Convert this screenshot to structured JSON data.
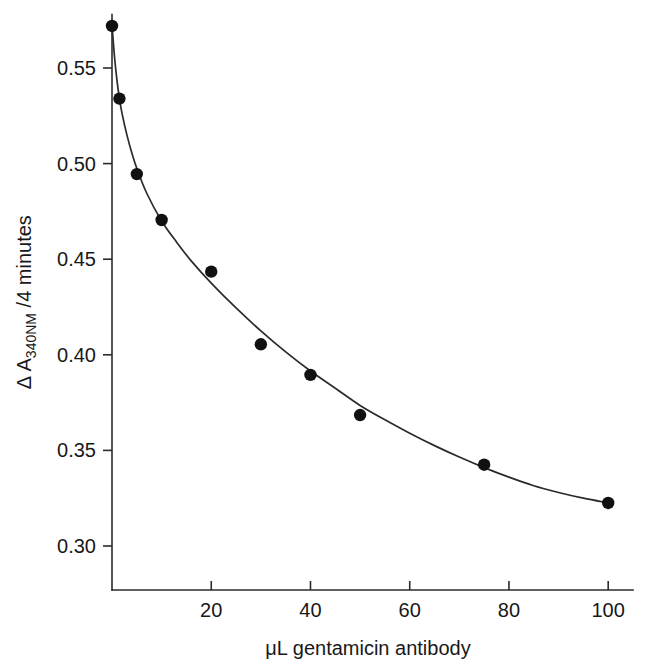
{
  "chart_data": {
    "type": "scatter",
    "title": "",
    "subtitle": "",
    "xlabel": "μL gentamicin antibody",
    "ylabel": "Δ A340NM /4 minutes",
    "ylabel_parts": {
      "delta": "Δ",
      "base": "A",
      "subscript": "340NM",
      "suffix": "/4 minutes"
    },
    "x": [
      0,
      1.5,
      5,
      10,
      20,
      30,
      40,
      50,
      75,
      100
    ],
    "y": [
      0.572,
      0.534,
      0.4945,
      0.4705,
      0.4435,
      0.4055,
      0.3895,
      0.3685,
      0.3425,
      0.3225
    ],
    "series": [
      {
        "name": "ΔA340NM per 4 minutes",
        "points": [
          {
            "x": 0,
            "y": 0.572
          },
          {
            "x": 1.5,
            "y": 0.534
          },
          {
            "x": 5,
            "y": 0.4945
          },
          {
            "x": 10,
            "y": 0.4705
          },
          {
            "x": 20,
            "y": 0.4435
          },
          {
            "x": 30,
            "y": 0.4055
          },
          {
            "x": 40,
            "y": 0.3895
          },
          {
            "x": 50,
            "y": 0.3685
          },
          {
            "x": 75,
            "y": 0.3425
          },
          {
            "x": 100,
            "y": 0.3225
          }
        ]
      }
    ],
    "fit_curve": {
      "description": "smooth monotonic decay fitted through the data points",
      "points": [
        {
          "x": 0.0,
          "y": 0.5725
        },
        {
          "x": 0.5,
          "y": 0.556
        },
        {
          "x": 1.0,
          "y": 0.5435
        },
        {
          "x": 1.5,
          "y": 0.534
        },
        {
          "x": 2.0,
          "y": 0.5265
        },
        {
          "x": 3.0,
          "y": 0.515
        },
        {
          "x": 4.0,
          "y": 0.5055
        },
        {
          "x": 5.0,
          "y": 0.4975
        },
        {
          "x": 7.0,
          "y": 0.4845
        },
        {
          "x": 10.0,
          "y": 0.47
        },
        {
          "x": 13.0,
          "y": 0.459
        },
        {
          "x": 16.0,
          "y": 0.449
        },
        {
          "x": 20.0,
          "y": 0.4375
        },
        {
          "x": 25.0,
          "y": 0.4245
        },
        {
          "x": 30.0,
          "y": 0.4125
        },
        {
          "x": 35.0,
          "y": 0.4015
        },
        {
          "x": 40.0,
          "y": 0.3915
        },
        {
          "x": 45.0,
          "y": 0.3825
        },
        {
          "x": 50.0,
          "y": 0.3735
        },
        {
          "x": 55.0,
          "y": 0.366
        },
        {
          "x": 60.0,
          "y": 0.359
        },
        {
          "x": 65.0,
          "y": 0.3525
        },
        {
          "x": 70.0,
          "y": 0.3465
        },
        {
          "x": 75.0,
          "y": 0.341
        },
        {
          "x": 80.0,
          "y": 0.336
        },
        {
          "x": 85.0,
          "y": 0.3315
        },
        {
          "x": 90.0,
          "y": 0.328
        },
        {
          "x": 95.0,
          "y": 0.325
        },
        {
          "x": 100.0,
          "y": 0.3225
        }
      ]
    },
    "xlim": [
      0,
      105
    ],
    "ylim": [
      0.277,
      0.578
    ],
    "xticks": [
      20,
      40,
      60,
      80,
      100
    ],
    "xtick_labels": [
      "20",
      "40",
      "60",
      "80",
      "100"
    ],
    "yticks": [
      0.3,
      0.35,
      0.4,
      0.45,
      0.5,
      0.55
    ],
    "ytick_labels": [
      "0.30",
      "0.35",
      "0.40",
      "0.45",
      "0.50",
      "0.55"
    ],
    "grid": false,
    "legend": null,
    "marker": "filled-circle",
    "marker_color": "#111111",
    "line_color": "#2b2b2b",
    "background": "#ffffff"
  }
}
